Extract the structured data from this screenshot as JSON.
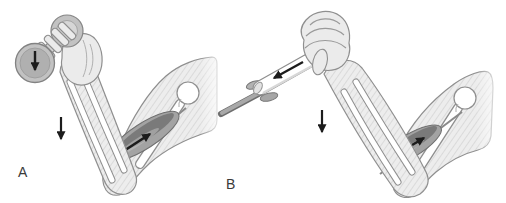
{
  "figure": {
    "panels": {
      "a": {
        "label": "A",
        "annotations": [
          "dumbbell-load-arrow-down",
          "forearm-lowering-arrow-down",
          "biceps-pull-arrow-toward-shoulder"
        ]
      },
      "b": {
        "label": "B",
        "annotations": [
          "handle-pull-arrow-along-shaft",
          "forearm-lowering-arrow-down",
          "biceps-pull-arrow-toward-shoulder"
        ]
      }
    }
  },
  "colors": {
    "background": "#ffffff",
    "outline": "#8f8f8f",
    "skin-fill": "#ededed",
    "hatch": "#cbcbcb",
    "hand-fill": "#ebebeb",
    "bone-fill": "#ffffff",
    "muscle-fill": "#a3a3a3",
    "muscle-dark": "#5f5f5f",
    "muscle-edge": "#6f6f6f",
    "metal-light": "#d6d6d6",
    "metal-mid": "#c2c2c2",
    "metal-dark": "#b0b0b0",
    "rod": "#a8a8a8",
    "rod-edge": "#6e6e6e",
    "arrow": "#1c1c1c",
    "label": "#3a3a3a"
  }
}
